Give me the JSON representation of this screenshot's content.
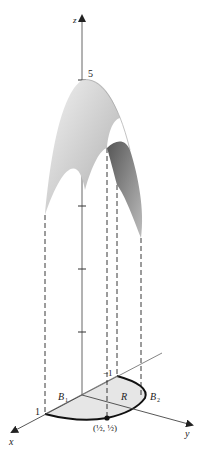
{
  "figure": {
    "caption_partial": "f(x, y) = 5 − 2x² − y²",
    "axes": {
      "x_label": "x",
      "y_label": "y",
      "z_label": "z"
    },
    "z_tick_label": "5",
    "x_tick_label": "1",
    "neg_x_tick_label": "−1",
    "region_label": "R",
    "boundary_labels": {
      "b1": "B",
      "b1_sub": "1",
      "b2": "B",
      "b2_sub": "2"
    },
    "point_label": "(½, ½)",
    "colors": {
      "surface_light": "#e8e8e8",
      "surface_mid": "#bdbdbd",
      "surface_dark": "#6e6e6e",
      "region_fill": "#e6e6e6",
      "axis": "#555555",
      "boundary": "#111111"
    }
  }
}
